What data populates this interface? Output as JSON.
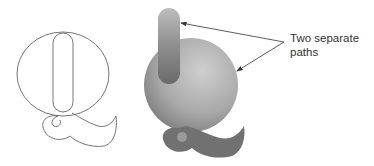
{
  "diagram": {
    "annotation": {
      "line1": "Two separate",
      "line2": "paths"
    },
    "figures": [
      {
        "name": "outline-q",
        "style": "outline"
      },
      {
        "name": "filled-q",
        "style": "gradient-filled"
      }
    ],
    "colors": {
      "outline_stroke": "#555555",
      "fill_light": "#c8c8c8",
      "fill_dark": "#6e6e6e",
      "tail_fill": "#707070",
      "arrow": "#333333"
    }
  }
}
